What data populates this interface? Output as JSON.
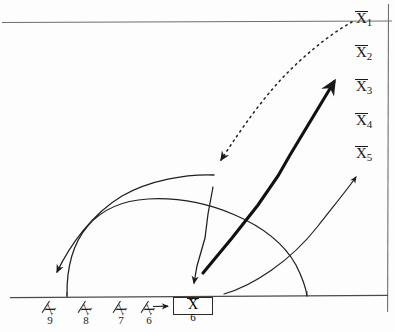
{
  "figure": {
    "kind": "hand-drawn-sketch-diagram",
    "background_color": "#fdfdfd",
    "ink_color": "#1a1a1a",
    "frame": {
      "top_rule": true,
      "right_rule": true,
      "baseline": true
    }
  },
  "right_labels": [
    {
      "name": "x-bar-1",
      "symbol": "X",
      "subscript": "1",
      "x": 356,
      "y": 10
    },
    {
      "name": "x-bar-2",
      "symbol": "X",
      "subscript": "2",
      "x": 356,
      "y": 44
    },
    {
      "name": "x-bar-3",
      "symbol": "X",
      "subscript": "3",
      "x": 356,
      "y": 78
    },
    {
      "name": "x-bar-4",
      "symbol": "X",
      "subscript": "4",
      "x": 356,
      "y": 112
    },
    {
      "name": "x-bar-5",
      "symbol": "X",
      "subscript": "5",
      "x": 356,
      "y": 145
    }
  ],
  "bottom_labels": [
    {
      "name": "x-bar-9",
      "symbol": "X",
      "subscript": "9",
      "x": 42,
      "y": 306
    },
    {
      "name": "x-bar-8",
      "symbol": "X",
      "subscript": "8",
      "x": 78,
      "y": 306
    },
    {
      "name": "x-bar-7",
      "symbol": "X",
      "subscript": "7",
      "x": 113,
      "y": 306
    },
    {
      "name": "x-bar-6",
      "symbol": "X",
      "subscript": "6",
      "x": 145,
      "y": 306
    }
  ],
  "boxed_label": {
    "name": "x-bar-6-boxed",
    "symbol": "X",
    "subscript": "6",
    "box": {
      "x": 173,
      "y": 297,
      "w": 40,
      "h": 18
    }
  },
  "arrow_annotation": {
    "name": "rightward-arrow",
    "glyph": "→",
    "from_label": "x-bar-6",
    "to_label": "x-bar-6-boxed"
  },
  "strokes": [
    {
      "name": "dome-arc",
      "style": "solid-thin",
      "description": "semicircular dome arc from baseline left to baseline right"
    },
    {
      "name": "curved-arrow-down-left",
      "style": "solid-thin-arrow",
      "description": "long curve sweeping from upper middle down to lower left, arrowhead at lower left"
    },
    {
      "name": "vertical-arrow-down",
      "style": "solid-thin-arrow",
      "description": "near-vertical stroke from dome top down to baseline, arrowhead at baseline"
    },
    {
      "name": "thick-arrow-up-right",
      "style": "solid-thick-arrow",
      "description": "bold straight stroke rising from lower middle to upper right, arrowhead near X-bar-2"
    },
    {
      "name": "dotted-arrow-down-left",
      "style": "dotted-arrow",
      "description": "dotted curve descending from X-bar-1 region toward middle, arrowhead at lower left end"
    },
    {
      "name": "thin-curve-up-right",
      "style": "solid-thin-arrow",
      "description": "thin curve rising from baseline right of centre to arrowhead near X-bar-5"
    }
  ]
}
